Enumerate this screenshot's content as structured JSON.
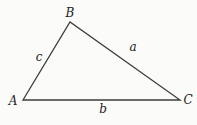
{
  "diagram": {
    "type": "triangle",
    "background_color": "#fbfbfa",
    "stroke_color": "#3d3d3d",
    "stroke_width": 1.3,
    "vertices": [
      {
        "name": "A",
        "x": 23,
        "y": 100
      },
      {
        "name": "B",
        "x": 70,
        "y": 22
      },
      {
        "name": "C",
        "x": 180,
        "y": 100
      }
    ],
    "vertex_labels": [
      {
        "text": "A",
        "x": 13,
        "y": 101
      },
      {
        "text": "B",
        "x": 70,
        "y": 13
      },
      {
        "text": "C",
        "x": 188,
        "y": 100
      }
    ],
    "side_labels": [
      {
        "text": "c",
        "x": 39,
        "y": 57
      },
      {
        "text": "a",
        "x": 133,
        "y": 47
      },
      {
        "text": "b",
        "x": 103,
        "y": 109
      }
    ]
  }
}
